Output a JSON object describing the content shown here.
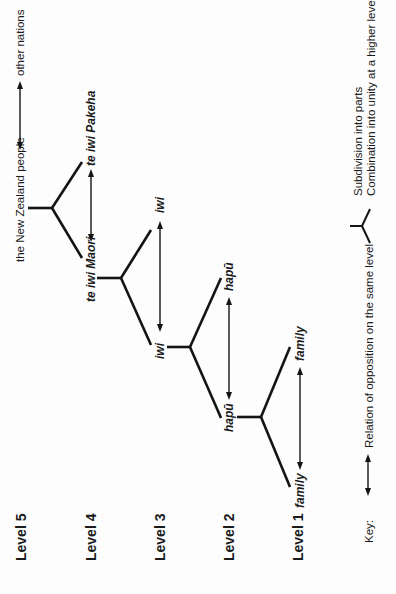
{
  "diagram": {
    "orientation": "rotated-90-ccw",
    "levels": [
      {
        "id": "level5",
        "label": "Level 5",
        "left": "the New Zealand people",
        "right": "other nations"
      },
      {
        "id": "level4",
        "label": "Level 4",
        "left": "te iwi Maori",
        "right": "te iwi Pakeha"
      },
      {
        "id": "level3",
        "label": "Level 3",
        "left": "iwi",
        "right": "iwi"
      },
      {
        "id": "level2",
        "label": "Level 2",
        "left": "hapū",
        "right": "hapū"
      },
      {
        "id": "level1",
        "label": "Level 1",
        "left": "family",
        "right": "family"
      }
    ],
    "relations": [
      {
        "type": "opposition",
        "from": "the New Zealand people",
        "to": "other nations"
      },
      {
        "type": "opposition",
        "from": "te iwi Maori",
        "to": "te iwi Pakeha"
      },
      {
        "type": "opposition",
        "from": "iwi",
        "to": "iwi"
      },
      {
        "type": "opposition",
        "from": "hapū",
        "to": "hapū"
      },
      {
        "type": "opposition",
        "from": "family",
        "to": "family"
      },
      {
        "type": "subdivision",
        "parent": "the New Zealand people",
        "children": [
          "te iwi Maori",
          "te iwi Pakeha"
        ]
      },
      {
        "type": "subdivision",
        "parent": "te iwi Maori",
        "children": [
          "iwi",
          "iwi"
        ]
      },
      {
        "type": "subdivision",
        "parent": "iwi",
        "children": [
          "hapū",
          "hapū"
        ]
      },
      {
        "type": "subdivision",
        "parent": "hapū",
        "children": [
          "family",
          "family"
        ]
      }
    ]
  },
  "key": {
    "title": "Key:",
    "opposition_label": "Relation of opposition on the same level",
    "fork_line1": "Subdivision into parts",
    "fork_line2": "Combination into unity at a higher level"
  },
  "colors": {
    "ink": "#141414",
    "background": "#fdfdfd"
  }
}
